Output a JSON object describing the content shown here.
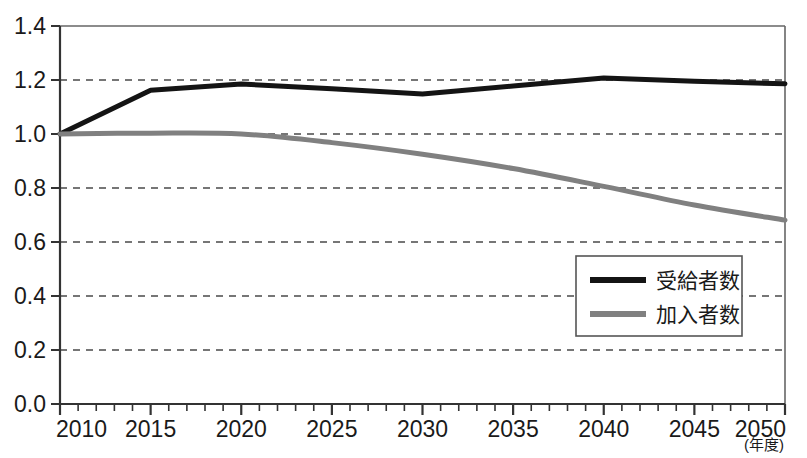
{
  "chart_data": {
    "type": "line",
    "title": "",
    "subtitle": "",
    "xlabel": "(年度)",
    "ylabel": "",
    "xlim": [
      2010,
      2050
    ],
    "ylim": [
      0.0,
      1.4
    ],
    "grid": true,
    "grid_style": "horizontal-dashed",
    "legend_position": "bottom-right",
    "x_ticks": [
      2010,
      2015,
      2020,
      2025,
      2030,
      2035,
      2040,
      2045,
      2050
    ],
    "x_tick_labels": [
      "2010",
      "2015",
      "2020",
      "2025",
      "2030",
      "2035",
      "2040",
      "2045",
      "2050"
    ],
    "x_minor_tick_interval": 1,
    "y_ticks": [
      0.0,
      0.2,
      0.4,
      0.6,
      0.8,
      1.0,
      1.2,
      1.4
    ],
    "y_tick_labels": [
      "0.0",
      "0.2",
      "0.4",
      "0.6",
      "0.8",
      "1.0",
      "1.2",
      "1.4"
    ],
    "x": [
      2010,
      2015,
      2020,
      2025,
      2030,
      2035,
      2040,
      2045,
      2050
    ],
    "series": [
      {
        "name": "受給者数",
        "color": "#141414",
        "line_width": 5,
        "values": [
          1.0,
          1.162,
          1.185,
          1.168,
          1.148,
          1.178,
          1.207,
          1.195,
          1.186
        ]
      },
      {
        "name": "加入者数",
        "color": "#808080",
        "line_width": 5,
        "values": [
          1.0,
          1.003,
          1.0,
          0.968,
          0.925,
          0.872,
          0.806,
          0.737,
          0.681
        ]
      }
    ],
    "annotations": []
  },
  "legend": {
    "entries": [
      {
        "label": "受給者数",
        "color": "#141414"
      },
      {
        "label": "加入者数",
        "color": "#808080"
      }
    ]
  },
  "axis": {
    "x_unit_note": "(年度)"
  }
}
